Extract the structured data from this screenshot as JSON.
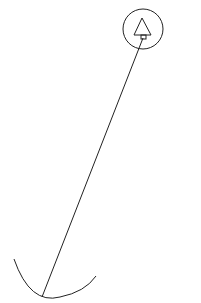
{
  "diagram": {
    "width": 201,
    "height": 303,
    "stroke_color": "#222222",
    "background": "#ffffff",
    "pivot_circle": {
      "cx": 143,
      "cy": 29,
      "r": 20
    },
    "triangle": {
      "points": "142,18 134,35 151,35"
    },
    "marker_square": {
      "x": 141,
      "y": 35,
      "w": 5,
      "h": 4
    },
    "rod": {
      "x1": 143,
      "y1": 38,
      "x2": 42,
      "y2": 297
    },
    "arc": {
      "path": "M 14 259 Q 30 305 60 297 Q 85 292 96 276"
    }
  }
}
